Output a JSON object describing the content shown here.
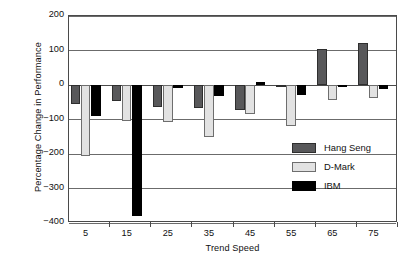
{
  "chart_data": {
    "type": "bar",
    "title": "",
    "xlabel": "Trend Speed",
    "ylabel": "Percentage Change in Performance",
    "categories": [
      "5",
      "15",
      "25",
      "35",
      "45",
      "55",
      "65",
      "75"
    ],
    "series": [
      {
        "name": "Hang Seng",
        "color": "#58585a",
        "values": [
          -55,
          -45,
          -65,
          -67,
          -72,
          -5,
          105,
          122
        ]
      },
      {
        "name": "D-Mark",
        "color": "#e2e2e2",
        "values": [
          -205,
          -105,
          -108,
          -150,
          -85,
          -120,
          -43,
          -37
        ]
      },
      {
        "name": "IBM",
        "color": "#000000",
        "values": [
          -90,
          -380,
          -10,
          -32,
          10,
          -28,
          -5,
          -12
        ]
      }
    ],
    "ylim": [
      -400,
      200
    ],
    "yticks": [
      200,
      100,
      0,
      -100,
      -200,
      -300,
      -400
    ],
    "ytick_labels": [
      "200",
      "100",
      "0",
      "−100",
      "−200",
      "−300",
      "−400"
    ],
    "grid": true,
    "legend_position": "inside-right"
  },
  "legend": {
    "entries": [
      {
        "label": "Hang Seng",
        "swatch": "hang-seng"
      },
      {
        "label": "D-Mark",
        "swatch": "d-mark"
      },
      {
        "label": "IBM",
        "swatch": "ibm"
      }
    ]
  }
}
